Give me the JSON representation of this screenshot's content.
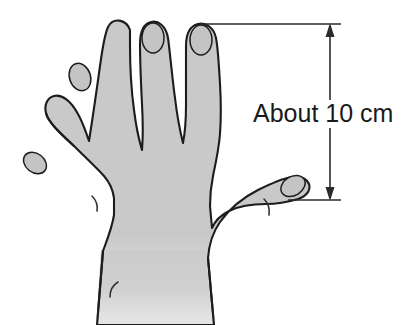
{
  "figure": {
    "background_color": "#ffffff"
  },
  "annotation": {
    "label": "About 10 cm",
    "value": "10",
    "unit": "cm",
    "qualifier": "About",
    "text_color": "#1a1a1a",
    "measures": "height of hand from fingertip of index finger down to base of thumb"
  },
  "dimension_line": {
    "name": "vertical-dimension-with-arrows",
    "line_color": "#2b2b2b",
    "arrow_top": "up-arrowhead",
    "arrow_bottom": "down-arrowhead",
    "top_extension_label": "upper extension line from index fingertip",
    "bottom_extension_label": "lower extension line from thumb base"
  },
  "hand": {
    "fill_color": "#c9c9c9",
    "outline_color": "#1c1c1c",
    "nail_outline_color": "#1c1c1c",
    "parts": [
      {
        "name": "pinky-finger",
        "label": "pinky"
      },
      {
        "name": "ring-finger",
        "label": "ring finger"
      },
      {
        "name": "middle-finger",
        "label": "middle finger"
      },
      {
        "name": "index-finger",
        "label": "index finger"
      },
      {
        "name": "thumb",
        "label": "thumb"
      },
      {
        "name": "palm",
        "label": "palm"
      },
      {
        "name": "wrist",
        "label": "wrist"
      }
    ],
    "nails": [
      {
        "name": "pinky-nail"
      },
      {
        "name": "ring-finger-nail"
      },
      {
        "name": "middle-finger-nail"
      },
      {
        "name": "index-finger-nail"
      },
      {
        "name": "thumb-nail"
      }
    ],
    "creases": [
      {
        "name": "pinky-web-crease"
      },
      {
        "name": "thumb-web-crease"
      },
      {
        "name": "wrist-crease"
      }
    ]
  }
}
